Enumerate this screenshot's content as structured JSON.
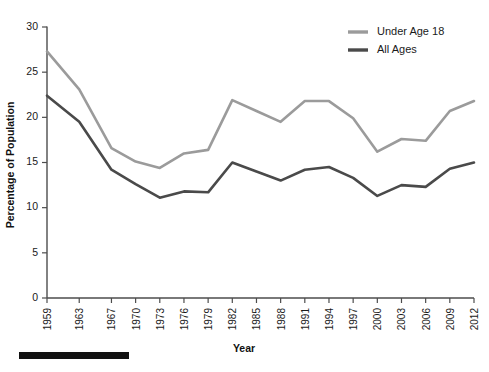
{
  "chart_data": {
    "type": "line",
    "title": "",
    "xlabel": "Year",
    "ylabel": "Percentage of Population",
    "xlim": [
      1959,
      2012
    ],
    "ylim": [
      0,
      30
    ],
    "ytick_step": 5,
    "grid": false,
    "legend_position": "top-right",
    "x": [
      1959,
      1960,
      1961,
      1962,
      1963,
      1964,
      1965,
      1966,
      1967,
      1968,
      1969,
      1970,
      1971,
      1972,
      1973,
      1974,
      1975,
      1976,
      1977,
      1978,
      1979,
      1980,
      1981,
      1982,
      1983,
      1984,
      1985,
      1986,
      1987,
      1988,
      1989,
      1990,
      1991,
      1992,
      1993,
      1994,
      1995,
      1996,
      1997,
      1998,
      1999,
      2000,
      2001,
      2002,
      2003,
      2004,
      2005,
      2006,
      2007,
      2008,
      2009,
      2010,
      2011,
      2012
    ],
    "categories": [
      "1959",
      "1963",
      "1967",
      "1970",
      "1973",
      "1976",
      "1979",
      "1982",
      "1985",
      "1988",
      "1991",
      "1994",
      "1997",
      "2000",
      "2003",
      "2006",
      "2009",
      "2012"
    ],
    "xtick_labels": [
      "1959",
      "1963",
      "1967",
      "1970",
      "1973",
      "1976",
      "1979",
      "1982",
      "1985",
      "1988",
      "1991",
      "1994",
      "1997",
      "2000",
      "2003",
      "2006",
      "2009",
      "2012"
    ],
    "xtick_values": [
      1959,
      1963,
      1967,
      1970,
      1973,
      1976,
      1979,
      1982,
      1985,
      1988,
      1991,
      1994,
      1997,
      2000,
      2003,
      2006,
      2009,
      2012
    ],
    "ytick_labels": [
      "0",
      "5",
      "10",
      "15",
      "20",
      "25",
      "30"
    ],
    "ytick_values": [
      0,
      5,
      10,
      15,
      20,
      25,
      30
    ],
    "series": [
      {
        "name": "Under Age 18",
        "color": "#9b9b9b",
        "x": [
          1959,
          1963,
          1967,
          1970,
          1973,
          1976,
          1979,
          1982,
          1985,
          1988,
          1991,
          1994,
          1997,
          2000,
          2003,
          2006,
          2009,
          2012
        ],
        "values": [
          27.3,
          23.1,
          16.6,
          15.1,
          14.4,
          16.0,
          16.4,
          21.9,
          20.7,
          19.5,
          21.8,
          21.8,
          19.9,
          16.2,
          17.6,
          17.4,
          20.7,
          21.8
        ]
      },
      {
        "name": "All Ages",
        "color": "#4a4a4a",
        "x": [
          1959,
          1963,
          1967,
          1970,
          1973,
          1976,
          1979,
          1982,
          1985,
          1988,
          1991,
          1994,
          1997,
          2000,
          2003,
          2006,
          2009,
          2012
        ],
        "values": [
          22.4,
          19.5,
          14.2,
          12.6,
          11.1,
          11.8,
          11.7,
          15.0,
          14.0,
          13.0,
          14.2,
          14.5,
          13.3,
          11.3,
          12.5,
          12.3,
          14.3,
          15.0
        ]
      }
    ],
    "legend": [
      {
        "label": "Under Age 18",
        "color": "#9b9b9b"
      },
      {
        "label": "All Ages",
        "color": "#4a4a4a"
      }
    ]
  },
  "footer": {
    "bar_present": true
  }
}
